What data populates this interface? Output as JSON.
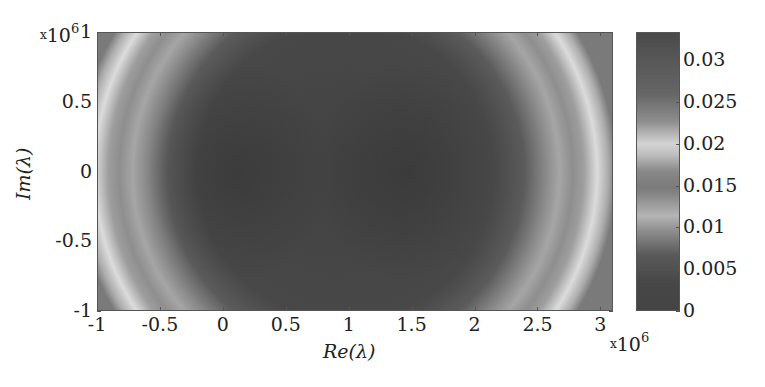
{
  "chart_data": {
    "type": "heatmap",
    "title": "",
    "xlabel": "Re(λ)",
    "ylabel": "Im(λ)",
    "x_multiplier": "×10^6",
    "y_multiplier": "×10^6",
    "xlim": [
      -1,
      3.1
    ],
    "ylim": [
      -1,
      1
    ],
    "xticks": [
      -1,
      -0.5,
      0,
      0.5,
      1,
      1.5,
      2,
      2.5,
      3
    ],
    "xtick_labels": [
      "-1",
      "-0.5",
      "0",
      "0.5",
      "1",
      "1.5",
      "2",
      "2.5",
      "3"
    ],
    "yticks": [
      -1,
      -0.5,
      0,
      0.5,
      1
    ],
    "ytick_labels": [
      "-1",
      "-0.5",
      "0",
      "0.5",
      "1"
    ],
    "colorbar": {
      "range": [
        0,
        0.0334
      ],
      "ticks": [
        0,
        0.005,
        0.01,
        0.015,
        0.02,
        0.025,
        0.03
      ],
      "tick_labels": [
        "0",
        "0.005",
        "0.01",
        "0.015",
        "0.02",
        "0.025",
        "0.03"
      ],
      "colormap": "grayscale (jet rendered in gray)"
    },
    "grid": false,
    "legend": null
  },
  "labels": {
    "xlabel": "Re(λ)",
    "ylabel": "Im(λ)",
    "x_mult_base": "10",
    "x_mult_exp": "6",
    "y_mult_base": "10",
    "y_mult_exp": "6",
    "mult_x": "x"
  },
  "colors": {
    "dark": "#3c3c3c",
    "mid": "#6e6e6e",
    "light": "#c8c8c8",
    "bright": "#e6e6e6",
    "axis": "#555555"
  }
}
